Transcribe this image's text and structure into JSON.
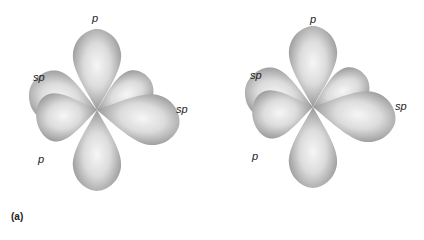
{
  "figure": {
    "caption": "(a)",
    "panels": [
      {
        "labels": {
          "top": "p",
          "upper_left": "sp",
          "right": "sp",
          "lower_left": "p"
        }
      },
      {
        "labels": {
          "top": "p",
          "upper_left": "sp",
          "right": "sp",
          "lower_left": "p"
        }
      }
    ],
    "colors": {
      "lobe_light": "#f4f4f4",
      "lobe_dark": "#8a8a8a",
      "background": "#ffffff"
    }
  }
}
